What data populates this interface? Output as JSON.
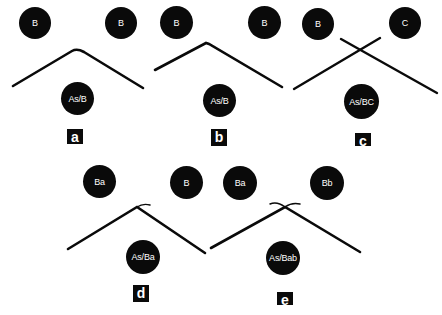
{
  "panels": [
    {
      "label": "a",
      "top_left": "B",
      "top_right": "B",
      "bottom": "As/B",
      "line": "single bend, smooth peak"
    },
    {
      "label": "b",
      "top_left": "B",
      "top_right": "B",
      "bottom": "As/B",
      "line": "single bend, sharp peak"
    },
    {
      "label": "c",
      "top_left": "B",
      "top_right": "C",
      "bottom": "As/BC",
      "line": "two crossing straight lines"
    },
    {
      "label": "d",
      "top_left": "Ba",
      "top_right": "B",
      "bottom": "As/Ba",
      "line": "bend with hook at peak"
    },
    {
      "label": "e",
      "top_left": "Ba",
      "top_right": "Bb",
      "bottom": "As/Bab",
      "line": "bend with crossing hooks at peak"
    }
  ],
  "colors": {
    "node_fill": "#0a0a0a",
    "node_text": "#ffffff",
    "line": "#0a0a0a",
    "background": "#ffffff"
  }
}
